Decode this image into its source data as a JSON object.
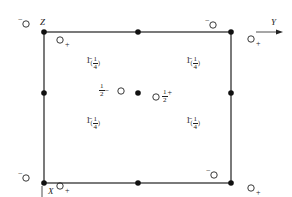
{
  "diagram": {
    "type": "space-group symmetry diagram",
    "axes": {
      "origin_label": "Z",
      "horizontal_label": "Y",
      "vertical_label": "X"
    },
    "inversion_label": "1̄",
    "inversion_height": "(1/4)",
    "inversion_height_num": "1",
    "inversion_height_den": "4",
    "center_left": {
      "num": "1",
      "den": "2",
      "sign": "−"
    },
    "center_right": {
      "num": "1",
      "den": "2",
      "sign": "+"
    },
    "sign_minus": "−",
    "sign_plus": "+",
    "colors": {
      "line": "#222222",
      "background": "#ffffff"
    }
  }
}
